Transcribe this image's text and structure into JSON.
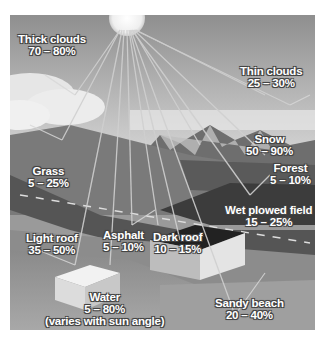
{
  "figure": {
    "type": "albedo-illustration",
    "labels": [
      {
        "id": "thick-clouds",
        "name": "Thick clouds",
        "range": "70 – 80%"
      },
      {
        "id": "thin-clouds",
        "name": "Thin clouds",
        "range": "25 – 30%"
      },
      {
        "id": "snow",
        "name": "Snow",
        "range": "50 – 90%"
      },
      {
        "id": "forest",
        "name": "Forest",
        "range": "5 – 10%"
      },
      {
        "id": "grass",
        "name": "Grass",
        "range": "5 – 25%"
      },
      {
        "id": "wet-plowed-field",
        "name": "Wet plowed field",
        "range": "15 – 25%"
      },
      {
        "id": "light-roof",
        "name": "Light roof",
        "range": "35 – 50%"
      },
      {
        "id": "asphalt",
        "name": "Asphalt",
        "range": "5 – 10%"
      },
      {
        "id": "dark-roof",
        "name": "Dark roof",
        "range": "10 – 15%"
      },
      {
        "id": "water",
        "name": "Water",
        "range": "5 – 80%",
        "note": "(varies with sun angle)"
      },
      {
        "id": "sandy-beach",
        "name": "Sandy beach",
        "range": "20 – 40%"
      }
    ]
  }
}
